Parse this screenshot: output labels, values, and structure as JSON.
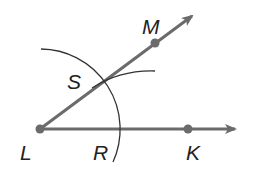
{
  "diagram": {
    "points": {
      "L": {
        "label": "L",
        "x": 40,
        "y": 129
      },
      "K": {
        "label": "K",
        "x": 188,
        "y": 129
      },
      "M": {
        "label": "M",
        "x": 155,
        "y": 43
      },
      "S": {
        "label": "S",
        "x": 104,
        "y": 81
      },
      "R": {
        "label": "R",
        "x": 120,
        "y": 129
      }
    },
    "rays": [
      {
        "from": "L",
        "through": "K"
      },
      {
        "from": "L",
        "through": "M"
      }
    ],
    "arcs": [
      {
        "center": "L",
        "radius": 80
      },
      {
        "center": "R",
        "through": "S"
      }
    ],
    "colors": {
      "line": "#6b6b6b",
      "point": "#6b6b6b",
      "arc": "#333333",
      "label": "#222222"
    }
  }
}
